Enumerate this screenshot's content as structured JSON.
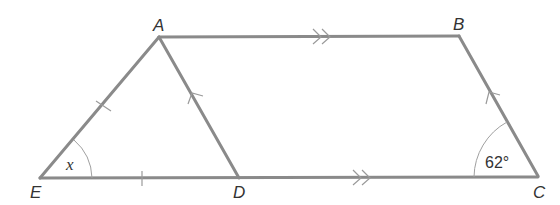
{
  "diagram": {
    "type": "geometry",
    "vertices": {
      "A": {
        "label": "A",
        "x": 159,
        "y": 37
      },
      "B": {
        "label": "B",
        "x": 459,
        "y": 36
      },
      "C": {
        "label": "C",
        "x": 538,
        "y": 176
      },
      "D": {
        "label": "D",
        "x": 239,
        "y": 178
      },
      "E": {
        "label": "E",
        "x": 40,
        "y": 178
      }
    },
    "segments": [
      "AB",
      "BC",
      "CE",
      "EA",
      "AD"
    ],
    "parallel_marks": {
      "double_arrow": [
        "AB",
        "DC"
      ],
      "single_arrow": [
        "AD",
        "BC"
      ]
    },
    "equal_length_ticks": [
      "EA",
      "ED"
    ],
    "angles": {
      "E": {
        "label": "x"
      },
      "C": {
        "label": "62°"
      }
    },
    "line_color": "#8a8a8a"
  }
}
